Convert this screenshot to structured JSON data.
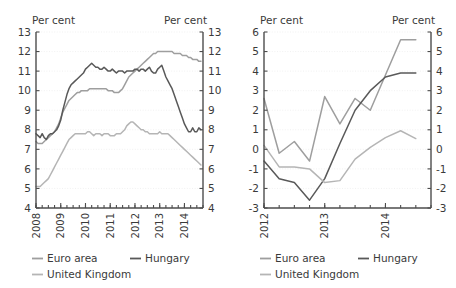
{
  "figure": {
    "background_color": "#ffffff",
    "panel_count": 2
  },
  "colors": {
    "euro_area": "#9e9e9e",
    "hungary": "#595959",
    "united_kingdom": "#b5b5b5",
    "axis": "#4d4d4d",
    "grid": "#ededed",
    "text": "#3a3a3a"
  },
  "legend": {
    "items": [
      {
        "label": "Euro area",
        "color_key": "euro_area"
      },
      {
        "label": "Hungary",
        "color_key": "hungary"
      },
      {
        "label": "United Kingdom",
        "color_key": "united_kingdom"
      }
    ]
  },
  "chart_data": [
    {
      "id": "left-panel",
      "type": "line",
      "title": "",
      "xlabel": "",
      "ylabel": "Per cent",
      "y_axis_unit_left": "Per cent",
      "y_axis_unit_right": "Per cent",
      "ylim": [
        4,
        13
      ],
      "yticks": [
        4,
        5,
        6,
        7,
        8,
        9,
        10,
        11,
        12,
        13
      ],
      "ytick_labels": [
        "4",
        "5",
        "6",
        "7",
        "8",
        "9",
        "10",
        "11",
        "12",
        "13"
      ],
      "xlim": [
        2008.0,
        2014.75
      ],
      "xticks": [
        2008,
        2009,
        2010,
        2011,
        2012,
        2013,
        2014
      ],
      "xtick_labels": [
        "2008",
        "2009",
        "2010",
        "2011",
        "2012",
        "2013",
        "2014"
      ],
      "grid": true,
      "legend_position": "below",
      "x": [
        2008.0,
        2008.083,
        2008.167,
        2008.25,
        2008.333,
        2008.417,
        2008.5,
        2008.583,
        2008.667,
        2008.75,
        2008.833,
        2008.917,
        2009.0,
        2009.083,
        2009.167,
        2009.25,
        2009.333,
        2009.417,
        2009.5,
        2009.583,
        2009.667,
        2009.75,
        2009.833,
        2009.917,
        2010.0,
        2010.083,
        2010.167,
        2010.25,
        2010.333,
        2010.417,
        2010.5,
        2010.583,
        2010.667,
        2010.75,
        2010.833,
        2010.917,
        2011.0,
        2011.083,
        2011.167,
        2011.25,
        2011.333,
        2011.417,
        2011.5,
        2011.583,
        2011.667,
        2011.75,
        2011.833,
        2011.917,
        2012.0,
        2012.083,
        2012.167,
        2012.25,
        2012.333,
        2012.417,
        2012.5,
        2012.583,
        2012.667,
        2012.75,
        2012.833,
        2012.917,
        2013.0,
        2013.083,
        2013.167,
        2013.25,
        2013.333,
        2013.417,
        2013.5,
        2013.583,
        2013.667,
        2013.75,
        2013.833,
        2013.917,
        2014.0,
        2014.083,
        2014.167,
        2014.25,
        2014.333,
        2014.417,
        2014.5,
        2014.583,
        2014.667
      ],
      "series": [
        {
          "name": "Euro area",
          "color_key": "euro_area",
          "values": [
            7.4,
            7.3,
            7.3,
            7.3,
            7.4,
            7.5,
            7.6,
            7.7,
            7.8,
            7.9,
            8.1,
            8.3,
            8.6,
            8.9,
            9.1,
            9.3,
            9.5,
            9.6,
            9.7,
            9.8,
            9.9,
            9.9,
            10.0,
            10.0,
            10.0,
            10.0,
            10.1,
            10.1,
            10.1,
            10.1,
            10.1,
            10.1,
            10.1,
            10.1,
            10.1,
            10.0,
            10.0,
            10.0,
            9.9,
            9.9,
            9.9,
            10.0,
            10.1,
            10.3,
            10.5,
            10.7,
            10.8,
            10.9,
            11.0,
            11.1,
            11.2,
            11.3,
            11.4,
            11.5,
            11.6,
            11.7,
            11.8,
            11.9,
            11.9,
            12.0,
            12.0,
            12.0,
            12.0,
            12.0,
            12.0,
            12.0,
            12.0,
            11.9,
            11.9,
            11.9,
            11.9,
            11.8,
            11.8,
            11.8,
            11.7,
            11.7,
            11.6,
            11.6,
            11.6,
            11.5,
            11.5
          ]
        },
        {
          "name": "Hungary",
          "color_key": "hungary",
          "values": [
            7.8,
            7.7,
            7.6,
            7.8,
            7.6,
            7.5,
            7.7,
            7.8,
            7.8,
            7.9,
            8.0,
            8.2,
            8.5,
            9.0,
            9.4,
            9.8,
            10.1,
            10.3,
            10.4,
            10.5,
            10.6,
            10.7,
            10.8,
            10.9,
            11.1,
            11.2,
            11.3,
            11.4,
            11.3,
            11.2,
            11.2,
            11.1,
            11.1,
            11.2,
            11.1,
            11.0,
            11.0,
            11.1,
            11.0,
            10.9,
            11.0,
            11.0,
            11.0,
            10.9,
            11.0,
            11.0,
            11.0,
            11.0,
            11.1,
            11.1,
            11.0,
            11.1,
            11.1,
            11.0,
            11.1,
            11.2,
            11.0,
            10.9,
            10.9,
            11.1,
            11.2,
            11.3,
            11.0,
            10.7,
            10.5,
            10.3,
            10.1,
            9.8,
            9.5,
            9.2,
            8.9,
            8.6,
            8.3,
            8.1,
            7.9,
            7.9,
            8.1,
            7.9,
            7.9,
            8.1,
            8.0
          ]
        },
        {
          "name": "United Kingdom",
          "color_key": "united_kingdom",
          "values": [
            5.1,
            5.1,
            5.1,
            5.2,
            5.3,
            5.4,
            5.5,
            5.7,
            5.9,
            6.1,
            6.3,
            6.5,
            6.7,
            6.9,
            7.1,
            7.3,
            7.5,
            7.6,
            7.7,
            7.8,
            7.8,
            7.8,
            7.8,
            7.8,
            7.8,
            7.9,
            7.9,
            7.8,
            7.7,
            7.8,
            7.8,
            7.8,
            7.7,
            7.8,
            7.8,
            7.8,
            7.7,
            7.7,
            7.7,
            7.8,
            7.8,
            7.8,
            7.9,
            8.0,
            8.2,
            8.3,
            8.4,
            8.4,
            8.3,
            8.2,
            8.1,
            8.0,
            8.0,
            7.9,
            7.9,
            7.8,
            7.8,
            7.8,
            7.8,
            7.8,
            7.9,
            7.8,
            7.8,
            7.8,
            7.8,
            7.7,
            7.6,
            7.5,
            7.4,
            7.3,
            7.2,
            7.1,
            7.0,
            6.9,
            6.8,
            6.7,
            6.6,
            6.5,
            6.4,
            6.3,
            6.2
          ]
        }
      ]
    },
    {
      "id": "right-panel",
      "type": "line",
      "title": "",
      "xlabel": "",
      "ylabel": "Per cent",
      "y_axis_unit_left": "Per cent",
      "y_axis_unit_right": "Per cent",
      "ylim": [
        -3,
        6
      ],
      "yticks": [
        -3,
        -2,
        -1,
        0,
        1,
        2,
        3,
        4,
        5,
        6
      ],
      "ytick_labels": [
        "-3",
        "-2",
        "-1",
        "0",
        "1",
        "2",
        "3",
        "4",
        "5",
        "6"
      ],
      "xlim": [
        2012.0,
        2014.75
      ],
      "xticks": [
        2012,
        2013,
        2014
      ],
      "xtick_labels": [
        "2012",
        "2013",
        "2014"
      ],
      "grid": true,
      "legend_position": "below",
      "x": [
        2012.0,
        2012.25,
        2012.5,
        2012.75,
        2013.0,
        2013.25,
        2013.5,
        2013.75,
        2014.0,
        2014.25,
        2014.5
      ],
      "series": [
        {
          "name": "Euro area",
          "color_key": "euro_area",
          "values": [
            2.6,
            -0.2,
            0.4,
            -0.6,
            2.7,
            1.3,
            2.6,
            2.0,
            3.8,
            5.6,
            5.6
          ]
        },
        {
          "name": "Hungary",
          "color_key": "hungary",
          "values": [
            -0.6,
            -1.5,
            -1.7,
            -2.6,
            -1.5,
            0.3,
            2.0,
            3.0,
            3.7,
            3.9,
            3.9
          ]
        },
        {
          "name": "United Kingdom",
          "color_key": "united_kingdom",
          "values": [
            0.2,
            -0.9,
            -0.9,
            -1.0,
            -1.7,
            -1.6,
            -0.5,
            0.1,
            0.6,
            0.95,
            0.55
          ]
        }
      ]
    }
  ]
}
